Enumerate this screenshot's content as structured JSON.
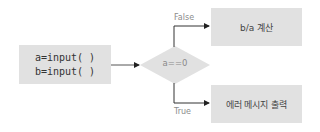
{
  "diagram": {
    "type": "flowchart",
    "nodes": {
      "input": {
        "line1": "a=input( )",
        "line2": "b=input( )"
      },
      "decision": {
        "label": "a==0"
      },
      "false_branch": {
        "label": "b/a 계산"
      },
      "true_branch": {
        "label": "에러 메시지 출력"
      }
    },
    "edges": {
      "false_label": "False",
      "true_label": "True"
    },
    "colors": {
      "node_fill": "#e1e1e1",
      "line": "#333333",
      "label_text": "#8c8c8c"
    }
  }
}
